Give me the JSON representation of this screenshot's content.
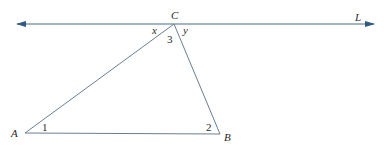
{
  "diagram": {
    "type": "geometry",
    "line": {
      "label": "L",
      "color": "#4a6a8a",
      "y": 24,
      "x_start": 17,
      "x_end": 374
    },
    "points": {
      "A": {
        "label": "A",
        "x": 25,
        "y": 133
      },
      "B": {
        "label": "B",
        "x": 220,
        "y": 134
      },
      "C": {
        "label": "C",
        "x": 174,
        "y": 24
      }
    },
    "angle_labels": {
      "angle1": "1",
      "angle2": "2",
      "angle3": "3",
      "angle_x": "x",
      "angle_y": "y"
    },
    "colors": {
      "triangle": "#6a7f92",
      "line": "#4a6a8a",
      "arrow": "#2f5a85",
      "text": "#2a2a2a"
    }
  }
}
